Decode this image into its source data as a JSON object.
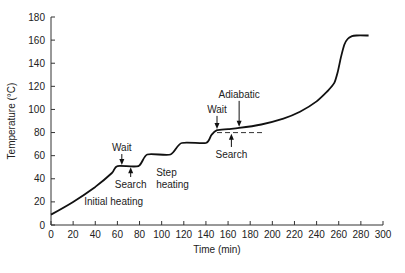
{
  "chart_data": {
    "type": "line",
    "title": "",
    "xlabel": "Time (min)",
    "ylabel": "Temperature (°C)",
    "xlim": [
      0,
      300
    ],
    "ylim": [
      0,
      180
    ],
    "xticks": [
      0,
      20,
      40,
      60,
      80,
      100,
      120,
      140,
      160,
      180,
      200,
      220,
      240,
      260,
      280,
      300
    ],
    "yticks": [
      0,
      20,
      40,
      60,
      80,
      100,
      120,
      140,
      160,
      180
    ],
    "grid": false,
    "legend": null,
    "series": [
      {
        "name": "Temperature",
        "style": "solid",
        "x": [
          0,
          20,
          40,
          55,
          60,
          79,
          87,
          108,
          118,
          140,
          145,
          150,
          160,
          170,
          190,
          210,
          225,
          240,
          250,
          256,
          259,
          262,
          265,
          268,
          272,
          276,
          287
        ],
        "y": [
          9,
          20,
          33,
          45,
          51,
          51,
          61,
          61,
          71,
          71,
          78,
          82,
          83,
          84,
          87,
          92,
          98,
          107,
          116,
          123,
          132,
          145,
          156,
          161,
          163.5,
          164,
          164
        ]
      },
      {
        "name": "Search threshold",
        "style": "dashed",
        "x": [
          150,
          193
        ],
        "y": [
          80,
          80
        ]
      }
    ],
    "annotations": [
      {
        "text": "Wait",
        "x": 64,
        "y": 64,
        "arrow_to": [
          64,
          52
        ],
        "arrow": "down"
      },
      {
        "text": "Search",
        "x": 72,
        "y": 32,
        "arrow_to": [
          72,
          50
        ],
        "arrow": "up"
      },
      {
        "text": "Initial heating",
        "x": 30,
        "y": 17
      },
      {
        "text": "Step heating",
        "x": 95,
        "y": 42
      },
      {
        "text": "Wait",
        "x": 150,
        "y": 97,
        "arrow_to": [
          150,
          83
        ],
        "arrow": "down"
      },
      {
        "text": "Adiabatic",
        "x": 170,
        "y": 110,
        "arrow_to": [
          170,
          85
        ],
        "arrow": "down"
      },
      {
        "text": "Search",
        "x": 163,
        "y": 58,
        "arrow_to": [
          163,
          79
        ],
        "arrow": "up"
      }
    ]
  }
}
